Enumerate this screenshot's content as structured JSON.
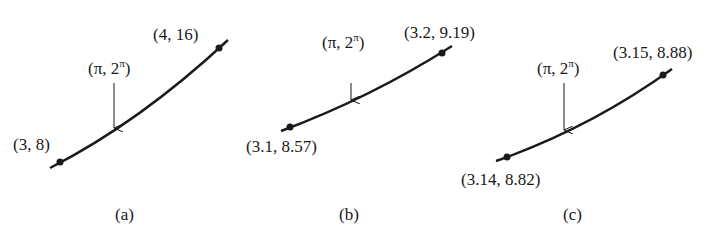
{
  "figure": {
    "panels": [
      {
        "caption": "(a)",
        "point_label": "(π, 2",
        "point_sup": "π",
        "point_close": ")",
        "left_label": "(3, 8)",
        "right_label": "(4, 16)"
      },
      {
        "caption": "(b)",
        "point_label": "(π, 2",
        "point_sup": "π",
        "point_close": ")",
        "left_label": "(3.1, 8.57)",
        "right_label": "(3.2, 9.19)"
      },
      {
        "caption": "(c)",
        "point_label": "(π, 2",
        "point_sup": "π",
        "point_close": ")",
        "left_label": "(3.14, 8.82)",
        "right_label": "(3.15, 8.88)"
      }
    ]
  },
  "colors": {
    "ink": "#1a1a1a",
    "background": "#ffffff"
  }
}
